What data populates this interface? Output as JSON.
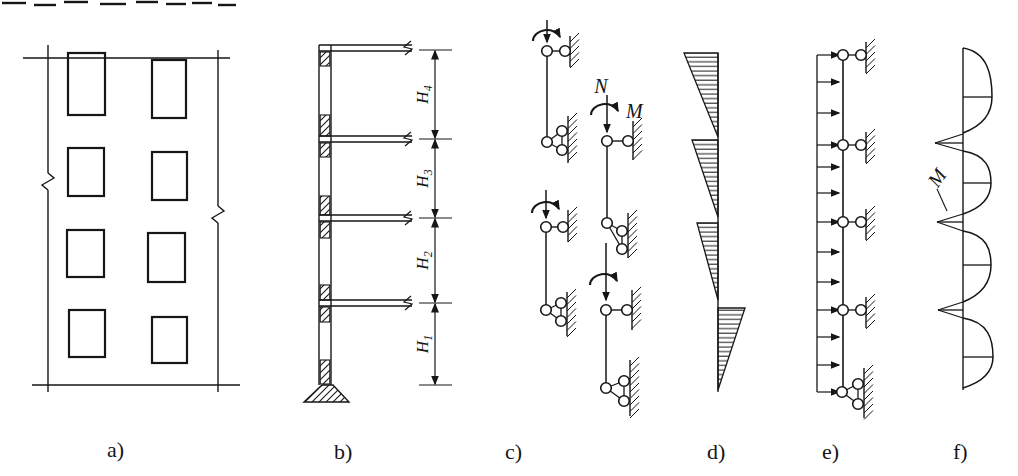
{
  "colors": {
    "ink": "#161616",
    "paper": "#ffffff"
  },
  "header": {
    "note_fragments": [
      [
        2,
        26,
        3
      ],
      [
        34,
        56,
        5
      ],
      [
        64,
        88,
        2
      ],
      [
        100,
        126,
        4
      ],
      [
        136,
        158,
        2
      ],
      [
        166,
        186,
        4
      ],
      [
        192,
        212,
        3
      ],
      [
        218,
        236,
        5
      ]
    ]
  },
  "labels": {
    "a": "a)",
    "b": "b)",
    "c": "c)",
    "d": "d)",
    "e": "e)",
    "f": "f)"
  },
  "panel_a": {
    "top_line": [
      23,
      58,
      230,
      58
    ],
    "bottom_line": [
      32,
      385,
      240,
      385
    ],
    "left_edge": {
      "x": 48,
      "y1": 45,
      "y2": 392,
      "break_y": 181
    },
    "right_edge": {
      "x": 218,
      "y1": 50,
      "y2": 392,
      "break_y": 214
    },
    "windows": [
      [
        68,
        53,
        37,
        62
      ],
      [
        152,
        60,
        34,
        58
      ],
      [
        68,
        148,
        36,
        48
      ],
      [
        152,
        152,
        35,
        48
      ],
      [
        67,
        230,
        37,
        47
      ],
      [
        148,
        233,
        37,
        49
      ],
      [
        69,
        310,
        36,
        47
      ],
      [
        152,
        317,
        35,
        46
      ]
    ],
    "window_rows": 4,
    "window_cols": 2
  },
  "panel_b": {
    "column": {
      "x1": 319,
      "x2": 331,
      "top": 45,
      "bottom": 385
    },
    "slab_right_x": 412,
    "slabs": [
      45,
      136,
      215,
      300
    ],
    "slab_thickness": 6,
    "hatch_blocks": [
      [
        52,
        66
      ],
      [
        115,
        136
      ],
      [
        143,
        157
      ],
      [
        196,
        215
      ],
      [
        222,
        238
      ],
      [
        285,
        300
      ],
      [
        307,
        322
      ],
      [
        360,
        384
      ]
    ],
    "footing": [
      [
        322,
        385
      ],
      [
        333,
        385
      ],
      [
        349,
        402
      ],
      [
        304,
        402
      ]
    ],
    "dim": {
      "x": 435,
      "ticks": [
        50,
        139,
        218,
        303,
        385
      ],
      "labels": [
        {
          "main": "H",
          "sub": "4"
        },
        {
          "main": "H",
          "sub": "3"
        },
        {
          "main": "H",
          "sub": "2"
        },
        {
          "main": "H",
          "sub": "1"
        }
      ]
    }
  },
  "panel_c": {
    "force_label": "N",
    "moment_label": "M",
    "stories": [
      {
        "x": 547,
        "top_pin_y": 51,
        "bottom_y": 142,
        "moment": {
          "cx": 547,
          "cy": 34
        },
        "force": {
          "y1": 20,
          "y2": 42
        },
        "top_wall_pin_x": 565,
        "top_wall": [
          570,
          36,
          67
        ],
        "cluster": {
          "pins": [
            [
              562,
              131
            ],
            [
              562,
              150
            ]
          ],
          "wall": [
            568,
            116,
            163
          ]
        }
      },
      {
        "x": 546,
        "top_pin_y": 227,
        "bottom_y": 310,
        "moment": {
          "cx": 546,
          "cy": 206
        },
        "force": {
          "y1": 190,
          "y2": 218
        },
        "top_wall_pin_x": 563,
        "top_wall": [
          568,
          210,
          242
        ],
        "cluster": {
          "pins": [
            [
              561,
              303
            ],
            [
              561,
              321
            ]
          ],
          "wall": [
            567,
            292,
            336
          ]
        }
      },
      {
        "x": 607,
        "top_pin_y": 141,
        "bottom_y": 223,
        "moment": {
          "cx": 605,
          "cy": 108
        },
        "force": {
          "y1": 95,
          "y2": 132
        },
        "top_wall_pin_x": 628,
        "top_wall": [
          633,
          121,
          160
        ],
        "cluster": {
          "pins": [
            [
              622,
              231
            ],
            [
              622,
              249
            ]
          ],
          "wall": [
            628,
            213,
            258
          ]
        }
      },
      {
        "x": 606,
        "top_pin_y": 310,
        "bottom_y": 388,
        "moment": {
          "cx": 604,
          "cy": 278
        },
        "force": {
          "y1": 243,
          "y2": 300
        },
        "top_wall_pin_x": 627,
        "top_wall": [
          632,
          290,
          330
        ],
        "cluster": {
          "pins": [
            [
              624,
              381
            ],
            [
              624,
              401
            ]
          ],
          "wall": [
            630,
            360,
            416
          ]
        }
      }
    ]
  },
  "panel_d": {
    "axis_x": 718,
    "axis_top": 53,
    "axis_bottom": 392,
    "triangles": [
      {
        "side": "left",
        "top": 53,
        "bottom": 137,
        "width": 34
      },
      {
        "side": "left",
        "top": 140,
        "bottom": 217,
        "width": 26
      },
      {
        "side": "left",
        "top": 223,
        "bottom": 300,
        "width": 21
      },
      {
        "side": "right",
        "top": 308,
        "bottom": 390,
        "width": 27
      }
    ]
  },
  "panel_e": {
    "load_line_x": 817,
    "member_x": 843,
    "top": 55,
    "bottom": 392,
    "arrow_ys": [
      55,
      82,
      113,
      145,
      167,
      193,
      222,
      252,
      282,
      310,
      337,
      365,
      392
    ],
    "floor_ys": [
      55,
      145,
      222,
      310
    ],
    "wall_pin_x": 861,
    "support_wall_x": 866,
    "base_cluster": {
      "pins": [
        [
          858,
          384
        ],
        [
          858,
          404
        ]
      ],
      "wall": [
        864,
        368,
        418
      ]
    }
  },
  "panel_f": {
    "axis_x": 963,
    "top": 48,
    "bottom": 390,
    "stories": [
      {
        "y1": 48,
        "y2": 133,
        "bulge": 29,
        "tick_y": 97
      },
      {
        "y1": 151,
        "y2": 214,
        "bulge": 28,
        "tick_y": 183
      },
      {
        "y1": 231,
        "y2": 302,
        "bulge": 28,
        "tick_y": 265
      },
      {
        "y1": 318,
        "y2": 388,
        "bulge": 30,
        "tick_y": 357
      }
    ],
    "spikes": [
      {
        "y": 143,
        "y1": 134,
        "y2": 151,
        "tip_x": 935
      },
      {
        "y": 222,
        "y1": 214,
        "y2": 231,
        "tip_x": 937
      },
      {
        "y": 310,
        "y1": 302,
        "y2": 318,
        "tip_x": 938
      }
    ],
    "m_label": {
      "text": "M",
      "x": 940,
      "y": 183,
      "rotate": -55
    },
    "leader": [
      937,
      189,
      947,
      211
    ]
  }
}
